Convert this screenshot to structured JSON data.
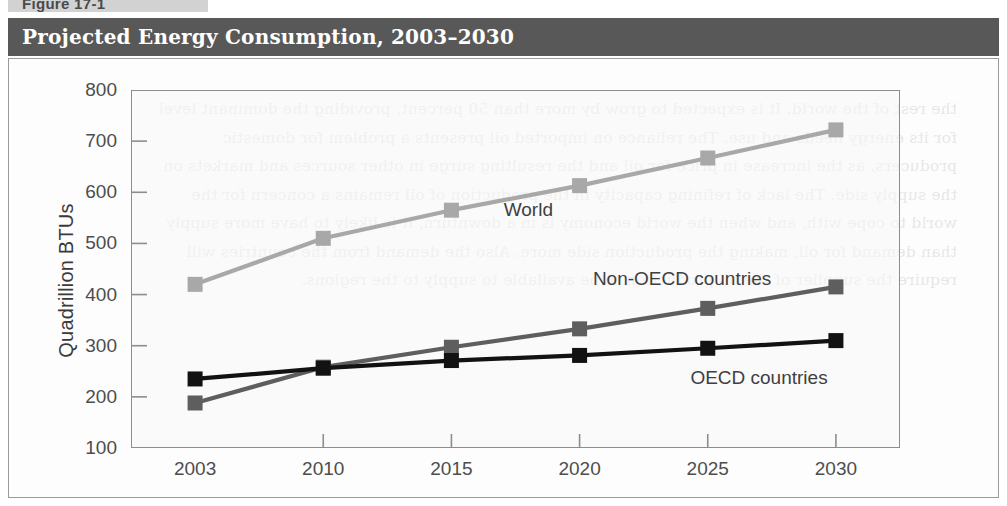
{
  "figure": {
    "tab_label": "Figure 17-1",
    "title": "Projected Energy Consumption, 2003–2030"
  },
  "colors": {
    "title_bar": "#585858",
    "tab": "#d2d2d2",
    "frame_border": "#9a9a9a",
    "plot_border": "#8d8d8d",
    "world": "#a8a8a8",
    "non_oecd": "#5e5e5e",
    "oecd": "#121212",
    "tick_text": "#4d4d4d"
  },
  "ghost_text": "the rest of the world. It is expected to grow by more than 50 percent, providing the dominant level for its energy needs and use. The reliance on imported oil presents a problem for domestic producers, as the increase in price for oil and the resulting surge in other sources and markets on the supply side. The lack of refining capacity in the production of oil remains a concern for the world to cope with, and when the world economy is in a downturn, it is likely to have more supply than demand for oil, making the production side more. Also the demand from the countries will require the supplier of the oil production to be available to supply to the regions.",
  "chart_data": {
    "type": "line",
    "title": "Projected Energy Consumption, 2003–2030",
    "xlabel": "",
    "ylabel": "Quadrillion BTUs",
    "x": [
      "2003",
      "2010",
      "2015",
      "2020",
      "2025",
      "2030"
    ],
    "ylim": [
      100,
      800
    ],
    "ytick_labels": [
      "800",
      "700",
      "600",
      "500",
      "400",
      "300",
      "200",
      "100"
    ],
    "yticks": [
      800,
      700,
      600,
      500,
      400,
      300,
      200,
      100
    ],
    "grid": false,
    "legend": "inline-labels",
    "series": [
      {
        "name": "World",
        "color": "#a8a8a8",
        "values": [
          420,
          510,
          565,
          613,
          667,
          722
        ],
        "label_x": "2018",
        "label_value": 565
      },
      {
        "name": "Non-OECD countries",
        "color": "#5e5e5e",
        "values": [
          188,
          258,
          297,
          333,
          373,
          415
        ],
        "label_x": "2024",
        "label_value": 430
      },
      {
        "name": "OECD countries",
        "color": "#121212",
        "values": [
          235,
          256,
          271,
          281,
          295,
          310
        ],
        "label_x": "2027",
        "label_value": 236
      }
    ]
  }
}
